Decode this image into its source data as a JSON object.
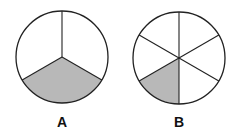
{
  "figures": [
    {
      "label": "A",
      "cx": 62,
      "cy": 57,
      "r": 46,
      "divisions": 3,
      "shaded": [
        1
      ],
      "start_angle_deg": -90
    },
    {
      "label": "B",
      "cx": 179,
      "cy": 58,
      "r": 46,
      "divisions": 6,
      "shaded": [
        3
      ],
      "start_angle_deg": -90
    }
  ],
  "colors": {
    "shade": "#b8b8b8",
    "stroke": "#222222"
  }
}
